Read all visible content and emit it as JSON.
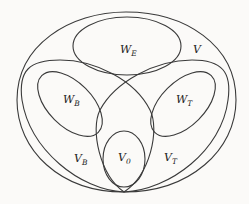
{
  "diagram": {
    "type": "set-diagram",
    "stroke_color": "#3a3a3a",
    "background": "#fbfaf8",
    "regions": [
      {
        "id": "V",
        "label_main": "V",
        "label_sub": "",
        "description": "outer set"
      },
      {
        "id": "W_E",
        "label_main": "W",
        "label_sub": "E",
        "description": "top ellipse"
      },
      {
        "id": "V_B",
        "label_main": "V",
        "label_sub": "B",
        "description": "left loop"
      },
      {
        "id": "W_B",
        "label_main": "W",
        "label_sub": "B",
        "description": "ellipse inside left loop"
      },
      {
        "id": "V_T",
        "label_main": "V",
        "label_sub": "T",
        "description": "right loop"
      },
      {
        "id": "W_T",
        "label_main": "W",
        "label_sub": "T",
        "description": "ellipse inside right loop"
      },
      {
        "id": "V_0",
        "label_main": "V",
        "label_sub": "0",
        "description": "bottom center ellipse"
      }
    ]
  }
}
